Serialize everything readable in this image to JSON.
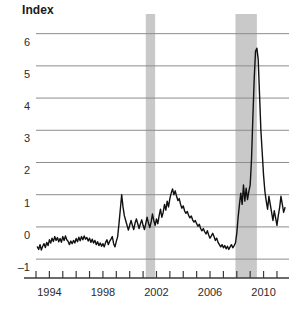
{
  "chart_data": {
    "type": "line",
    "title": "",
    "subtitle": "",
    "ylabel": "Index",
    "xlabel": "",
    "ylim": [
      -1.4,
      6.3
    ],
    "xlim": [
      1993.0,
      2011.9
    ],
    "grid": true,
    "legend": null,
    "y_ticks": [
      6,
      5,
      4,
      3,
      2,
      1,
      0,
      -1
    ],
    "y_tick_labels": [
      "6",
      "5",
      "4",
      "3",
      "2",
      "1",
      "0",
      "-1"
    ],
    "x_ticks": [
      1993,
      1994,
      1995,
      1996,
      1997,
      1998,
      1999,
      2000,
      2001,
      2002,
      2003,
      2004,
      2005,
      2006,
      2007,
      2008,
      2009,
      2010,
      2011
    ],
    "x_tick_labels": [
      "",
      "1994",
      "",
      "",
      "",
      "1998",
      "",
      "",
      "",
      "2002",
      "",
      "",
      "",
      "2006",
      "",
      "",
      "",
      "2010",
      ""
    ],
    "line_color": "#111111",
    "line_width": 1.4,
    "shaded_bands": [
      {
        "label": "recession-2001",
        "x0": 2001.2,
        "x1": 2001.9,
        "color": "#c9c9c9"
      },
      {
        "label": "recession-2007-2009",
        "x0": 2007.9,
        "x1": 2009.5,
        "color": "#c9c9c9"
      }
    ],
    "series": [
      {
        "name": "Index",
        "x": [
          1993.1,
          1993.2,
          1993.3,
          1993.4,
          1993.5,
          1993.6,
          1993.7,
          1993.8,
          1993.9,
          1994.0,
          1994.1,
          1994.2,
          1994.3,
          1994.4,
          1994.5,
          1994.6,
          1994.7,
          1994.8,
          1994.9,
          1995.0,
          1995.1,
          1995.2,
          1995.3,
          1995.4,
          1995.5,
          1995.6,
          1995.7,
          1995.8,
          1995.9,
          1996.0,
          1996.1,
          1996.2,
          1996.3,
          1996.4,
          1996.5,
          1996.6,
          1996.7,
          1996.8,
          1996.9,
          1997.0,
          1997.1,
          1997.2,
          1997.3,
          1997.4,
          1997.5,
          1997.6,
          1997.7,
          1997.8,
          1997.9,
          1998.0,
          1998.1,
          1998.2,
          1998.3,
          1998.4,
          1998.5,
          1998.6,
          1998.7,
          1998.8,
          1998.9,
          1999.0,
          1999.1,
          1999.2,
          1999.3,
          1999.4,
          1999.5,
          1999.6,
          1999.7,
          1999.8,
          1999.9,
          2000.0,
          2000.1,
          2000.2,
          2000.3,
          2000.4,
          2000.5,
          2000.6,
          2000.7,
          2000.8,
          2000.9,
          2001.0,
          2001.1,
          2001.2,
          2001.3,
          2001.4,
          2001.5,
          2001.6,
          2001.7,
          2001.8,
          2001.9,
          2002.0,
          2002.1,
          2002.2,
          2002.3,
          2002.4,
          2002.5,
          2002.6,
          2002.7,
          2002.8,
          2002.9,
          2003.0,
          2003.1,
          2003.2,
          2003.3,
          2003.4,
          2003.5,
          2003.6,
          2003.7,
          2003.8,
          2003.9,
          2004.0,
          2004.1,
          2004.2,
          2004.3,
          2004.4,
          2004.5,
          2004.6,
          2004.7,
          2004.8,
          2004.9,
          2005.0,
          2005.1,
          2005.2,
          2005.3,
          2005.4,
          2005.5,
          2005.6,
          2005.7,
          2005.8,
          2005.9,
          2006.0,
          2006.1,
          2006.2,
          2006.3,
          2006.4,
          2006.5,
          2006.6,
          2006.7,
          2006.8,
          2006.9,
          2007.0,
          2007.1,
          2007.2,
          2007.3,
          2007.4,
          2007.5,
          2007.6,
          2007.7,
          2007.8,
          2007.9,
          2008.0,
          2008.1,
          2008.2,
          2008.3,
          2008.4,
          2008.5,
          2008.6,
          2008.7,
          2008.8,
          2008.9,
          2009.0,
          2009.1,
          2009.2,
          2009.3,
          2009.4,
          2009.5,
          2009.6,
          2009.7,
          2009.8,
          2009.9,
          2010.0,
          2010.1,
          2010.2,
          2010.3,
          2010.4,
          2010.5,
          2010.6,
          2010.7,
          2010.8,
          2010.9,
          2011.0,
          2011.1,
          2011.2,
          2011.3,
          2011.4,
          2011.5,
          2011.6
        ],
        "y": [
          -0.62,
          -0.7,
          -0.55,
          -0.72,
          -0.6,
          -0.52,
          -0.64,
          -0.48,
          -0.58,
          -0.4,
          -0.5,
          -0.35,
          -0.45,
          -0.3,
          -0.42,
          -0.33,
          -0.46,
          -0.36,
          -0.48,
          -0.3,
          -0.42,
          -0.28,
          -0.4,
          -0.45,
          -0.55,
          -0.44,
          -0.52,
          -0.42,
          -0.5,
          -0.36,
          -0.46,
          -0.32,
          -0.43,
          -0.3,
          -0.4,
          -0.28,
          -0.38,
          -0.33,
          -0.44,
          -0.35,
          -0.48,
          -0.38,
          -0.5,
          -0.42,
          -0.55,
          -0.46,
          -0.58,
          -0.5,
          -0.6,
          -0.52,
          -0.62,
          -0.48,
          -0.4,
          -0.55,
          -0.45,
          -0.38,
          -0.3,
          -0.52,
          -0.62,
          -0.45,
          -0.3,
          0.1,
          0.55,
          1.0,
          0.62,
          0.35,
          0.2,
          0.05,
          -0.1,
          0.05,
          0.2,
          0.05,
          -0.08,
          0.12,
          0.25,
          0.1,
          -0.05,
          0.1,
          0.22,
          0.05,
          -0.08,
          0.1,
          0.3,
          0.12,
          -0.02,
          0.15,
          0.4,
          0.2,
          0.05,
          0.25,
          0.1,
          0.35,
          0.55,
          0.3,
          0.45,
          0.7,
          0.52,
          0.8,
          0.62,
          0.88,
          1.05,
          1.18,
          1.0,
          1.12,
          0.95,
          0.82,
          0.88,
          0.7,
          0.58,
          0.65,
          0.5,
          0.42,
          0.48,
          0.36,
          0.28,
          0.34,
          0.22,
          0.15,
          0.2,
          0.1,
          0.02,
          0.08,
          -0.05,
          -0.12,
          -0.05,
          -0.15,
          -0.22,
          -0.12,
          -0.25,
          -0.35,
          -0.28,
          -0.2,
          -0.3,
          -0.42,
          -0.35,
          -0.48,
          -0.55,
          -0.62,
          -0.55,
          -0.65,
          -0.58,
          -0.68,
          -0.6,
          -0.7,
          -0.62,
          -0.55,
          -0.65,
          -0.58,
          -0.5,
          -0.2,
          0.3,
          0.7,
          1.05,
          0.7,
          1.3,
          0.8,
          1.2,
          0.85,
          1.1,
          1.3,
          2.1,
          3.4,
          4.6,
          5.45,
          5.55,
          5.2,
          4.1,
          3.0,
          2.3,
          1.6,
          1.1,
          0.8,
          0.55,
          0.95,
          0.7,
          0.45,
          0.2,
          0.5,
          0.28,
          0.05,
          0.35,
          0.6,
          0.95,
          0.7,
          0.45,
          0.6
        ]
      }
    ]
  },
  "axes": {
    "y_axis_title": "Index"
  }
}
